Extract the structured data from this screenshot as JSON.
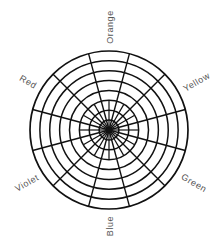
{
  "diagram": {
    "type": "polar-grid color wheel",
    "center": {
      "x": 109,
      "y": 130
    },
    "outer_radius": 79,
    "ring_count": 8,
    "outer_spoke_count": 12,
    "inner_spoke_count": 24,
    "line_color": "#111111",
    "label_color": "#555555",
    "labels": [
      {
        "text": "Orange",
        "x": 110,
        "y": 27,
        "rotate": -90
      },
      {
        "text": "Yellow",
        "x": 196,
        "y": 82,
        "rotate": -30
      },
      {
        "text": "Green",
        "x": 194,
        "y": 183,
        "rotate": 30
      },
      {
        "text": "Blue",
        "x": 110,
        "y": 226,
        "rotate": -90
      },
      {
        "text": "Violet",
        "x": 27,
        "y": 183,
        "rotate": -30
      },
      {
        "text": "Red",
        "x": 28,
        "y": 82,
        "rotate": 30
      }
    ]
  }
}
